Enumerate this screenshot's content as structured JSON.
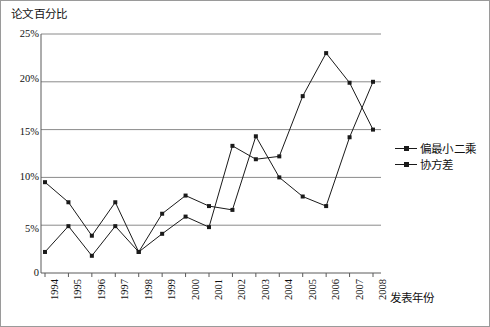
{
  "chart_data": {
    "type": "line",
    "title": "",
    "ylabel": "论文百分比",
    "xlabel": "发表年份",
    "categories": [
      "1994",
      "1995",
      "1996",
      "1997",
      "1998",
      "1999",
      "2000",
      "2001",
      "2002",
      "2003",
      "2004",
      "2005",
      "2006",
      "2007",
      "2008"
    ],
    "series": [
      {
        "name": "偏最小二乘",
        "values": [
          2.2,
          4.9,
          1.8,
          4.9,
          2.2,
          4.1,
          5.9,
          4.8,
          13.3,
          11.9,
          12.2,
          18.5,
          23.0,
          19.9,
          15.0
        ]
      },
      {
        "name": "协方差",
        "values": [
          9.5,
          7.4,
          3.9,
          7.4,
          2.2,
          6.2,
          8.1,
          7.0,
          6.6,
          14.3,
          10.0,
          8.0,
          7.0,
          14.2,
          20.0
        ]
      }
    ],
    "ylim": [
      0,
      25
    ],
    "ytick_labels": [
      "25%",
      "20%",
      "15%",
      "10%",
      "5%",
      "0"
    ],
    "ytick_values": [
      25,
      20,
      15,
      10,
      5,
      0
    ],
    "grid": true,
    "legend_position": "right",
    "line_color": "#1a1a1a",
    "grid_color": "#8a8a8a"
  }
}
